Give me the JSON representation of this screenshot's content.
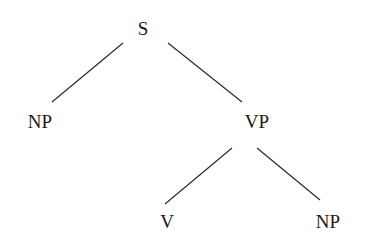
{
  "tree": {
    "nodes": {
      "s": {
        "label": "S",
        "x": 143,
        "y": 28
      },
      "np1": {
        "label": "NP",
        "x": 40,
        "y": 121
      },
      "vp": {
        "label": "VP",
        "x": 257,
        "y": 121
      },
      "v": {
        "label": "V",
        "x": 167,
        "y": 221
      },
      "np2": {
        "label": "NP",
        "x": 328,
        "y": 221
      }
    },
    "edges": [
      {
        "from": "S",
        "to": "NP",
        "x1": 123,
        "y1": 43,
        "x2": 52,
        "y2": 102
      },
      {
        "from": "S",
        "to": "VP",
        "x1": 168,
        "y1": 43,
        "x2": 242,
        "y2": 102
      },
      {
        "from": "VP",
        "to": "V",
        "x1": 232,
        "y1": 148,
        "x2": 165,
        "y2": 204
      },
      {
        "from": "VP",
        "to": "NP",
        "x1": 257,
        "y1": 148,
        "x2": 320,
        "y2": 200
      }
    ],
    "line_color": "#2a2a2a"
  }
}
